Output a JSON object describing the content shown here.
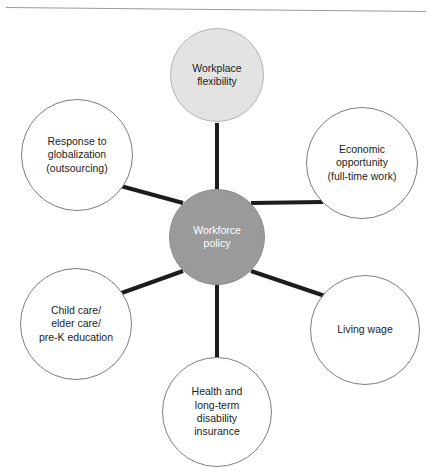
{
  "diagram": {
    "type": "hub-and-spoke",
    "title_rule": "divider-rule",
    "hub": {
      "id": "workforce-policy",
      "label": "Workforce\npolicy",
      "fill": "#9a9a9b",
      "text_color": "#ffffff",
      "cx": 217,
      "cy": 237,
      "r": 48
    },
    "nodes": [
      {
        "id": "workplace-flexibility",
        "label": "Workplace\nflexibility",
        "style": "shaded",
        "fill": "#e3e3e3",
        "text_color": "#1c1c1c",
        "cx": 217,
        "cy": 75,
        "r": 47
      },
      {
        "id": "economic-opportunity",
        "label": "Economic\nopportunity\n(full-time work)",
        "style": "outline",
        "fill": "#ffffff",
        "text_color": "#1c1c1c",
        "cx": 362,
        "cy": 163,
        "r": 56
      },
      {
        "id": "living-wage",
        "label": "Living wage",
        "style": "outline",
        "fill": "#ffffff",
        "text_color": "#1c1c1c",
        "cx": 365,
        "cy": 330,
        "r": 55
      },
      {
        "id": "health-disability-insurance",
        "label": "Health and\nlong-term\ndisability\ninsurance",
        "style": "outline",
        "fill": "#ffffff",
        "text_color": "#1c1c1c",
        "cx": 217,
        "cy": 412,
        "r": 55
      },
      {
        "id": "child-elder-care",
        "label": "Child care/\nelder care/\npre-K education",
        "style": "outline",
        "fill": "#ffffff",
        "text_color": "#1c1c1c",
        "cx": 76,
        "cy": 324,
        "r": 56
      },
      {
        "id": "response-to-globalization",
        "label": "Response to\nglobalization\n(outsourcing)",
        "style": "outline",
        "fill": "#ffffff",
        "text_color": "#1c1c1c",
        "cx": 77,
        "cy": 155,
        "r": 56
      }
    ],
    "connectors": {
      "color": "#1c1c1c",
      "width": 4,
      "count": 6,
      "edges": [
        {
          "from": "workforce-policy",
          "to": "workplace-flexibility"
        },
        {
          "from": "workforce-policy",
          "to": "economic-opportunity"
        },
        {
          "from": "workforce-policy",
          "to": "living-wage"
        },
        {
          "from": "workforce-policy",
          "to": "health-disability-insurance"
        },
        {
          "from": "workforce-policy",
          "to": "child-elder-care"
        },
        {
          "from": "workforce-policy",
          "to": "response-to-globalization"
        }
      ]
    }
  }
}
